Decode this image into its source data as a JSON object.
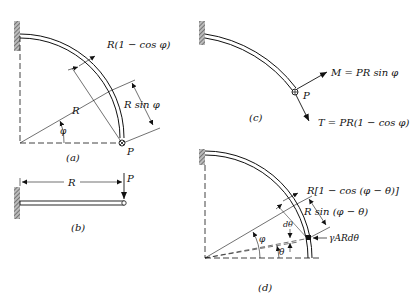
{
  "figure": {
    "panels": [
      {
        "id": "a",
        "caption": "(a)",
        "labels": {
          "top_dim": "R(1 − cos φ)",
          "side_dim": "R sin φ",
          "radius": "R",
          "angle": "φ",
          "load": "P"
        }
      },
      {
        "id": "b",
        "caption": "(b)",
        "labels": {
          "span": "R",
          "load": "P"
        }
      },
      {
        "id": "c",
        "caption": "(c)",
        "labels": {
          "moment": "M = PR sin φ",
          "torque": "T = PR(1 − cos φ)",
          "load": "P"
        }
      },
      {
        "id": "d",
        "caption": "(d)",
        "labels": {
          "top_dim": "R[1 − cos (φ − θ)]",
          "side_dim": "R sin (φ − θ)",
          "element_angle": "dθ",
          "element_load": "γARdθ",
          "angle_phi": "φ",
          "angle_theta": "θ"
        }
      }
    ],
    "colors": {
      "ink": "#111111",
      "background": "#ffffff",
      "wall_hatch": "#777777"
    }
  }
}
